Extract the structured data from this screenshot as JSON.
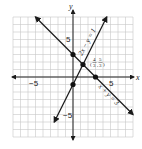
{
  "chart_data": {
    "type": "line",
    "title": "",
    "xlabel": "x",
    "ylabel": "y",
    "xlim": [
      -8,
      8
    ],
    "ylim": [
      -8,
      8
    ],
    "grid": true,
    "x_ticks_labeled": [
      "-5",
      "5"
    ],
    "y_ticks_labeled": [
      "5",
      "-5"
    ],
    "series": [
      {
        "name": "2x - y = 1",
        "label": "2x − y = 1",
        "equation": "y = 2x - 1",
        "points": [
          [
            -2.5,
            -6
          ],
          [
            4.5,
            8
          ]
        ]
      },
      {
        "name": "x + y = 3",
        "label": "x + y = 3",
        "equation": "y = -x + 3",
        "points": [
          [
            -5,
            8
          ],
          [
            8,
            -5
          ]
        ]
      }
    ],
    "marked_points": [
      {
        "x": 0,
        "y": 3,
        "label": ""
      },
      {
        "x": 0,
        "y": -1,
        "label": ""
      },
      {
        "x": 3,
        "y": 0,
        "label": ""
      },
      {
        "x": 1.333,
        "y": 1.667,
        "label": "(4/3, 5/3)"
      }
    ],
    "annotations": [
      {
        "text": "(4/3, 5/3)",
        "at": [
          1.333,
          1.667
        ]
      }
    ]
  },
  "labels": {
    "x_axis": "x",
    "y_axis": "y",
    "tick_neg5_x": "−5",
    "tick_pos5_x": "5",
    "tick_pos5_y": "5",
    "tick_neg5_y": "−5",
    "line1_label": "2x − y = 1",
    "line2_label": "x + y = 3",
    "intersection_num_x": "4",
    "intersection_den_x": "3",
    "intersection_num_y": "5",
    "intersection_den_y": "3"
  },
  "colors": {
    "grid": "#c8c8c8",
    "axis": "#222222",
    "line": "#1a1a1a",
    "point": "#111111"
  }
}
